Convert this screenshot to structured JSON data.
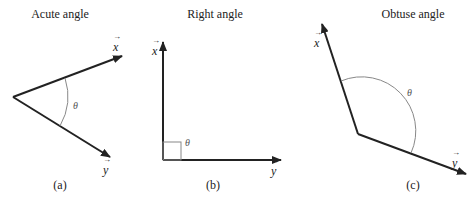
{
  "panels": [
    {
      "id": "a",
      "title": "Acute angle",
      "caption": "(a)",
      "vector_x": "x",
      "vector_y": "y",
      "angle_label": "θ"
    },
    {
      "id": "b",
      "title": "Right angle",
      "caption": "(b)",
      "vector_x": "x",
      "vector_y": "y",
      "angle_label": "θ"
    },
    {
      "id": "c",
      "title": "Obtuse angle",
      "caption": "(c)",
      "vector_x": "x",
      "vector_y": "y",
      "angle_label": "θ"
    }
  ]
}
